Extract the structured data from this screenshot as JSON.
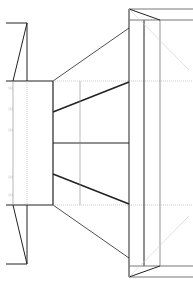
{
  "diagram": {
    "type": "technical-line-drawing",
    "colors": {
      "line": "#222222",
      "thin_line": "#777777",
      "hidden_line": "#aaaaaa",
      "background": "#ffffff"
    },
    "side_marks": [
      "[1]",
      "[1]",
      "[1]",
      "[1]",
      "[1]"
    ]
  }
}
